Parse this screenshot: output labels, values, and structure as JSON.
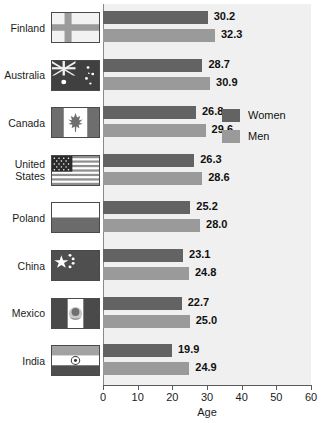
{
  "chart_data": {
    "type": "bar",
    "orientation": "horizontal",
    "title": "",
    "xlabel": "Age",
    "ylabel": "",
    "xlim": [
      0,
      60
    ],
    "xticks": [
      0,
      10,
      20,
      30,
      40,
      50,
      60
    ],
    "grid": false,
    "legend_position": "inside-right",
    "categories": [
      "Finland",
      "Australia",
      "Canada",
      "United\nStates",
      "Poland",
      "China",
      "Mexico",
      "India"
    ],
    "series": [
      {
        "name": "Women",
        "color": "#636363",
        "values": [
          30.2,
          28.7,
          26.8,
          26.3,
          25.2,
          23.1,
          22.7,
          19.9
        ],
        "labels": [
          "30.2",
          "28.7",
          "26.8",
          "26.3",
          "25.2",
          "23.1",
          "22.7",
          "19.9"
        ]
      },
      {
        "name": "Men",
        "color": "#9a9a9a",
        "values": [
          32.3,
          30.9,
          29.6,
          28.6,
          28.0,
          24.8,
          25.0,
          24.9
        ],
        "labels": [
          "32.3",
          "30.9",
          "29.6",
          "28.6",
          "28.0",
          "24.8",
          "25.0",
          "24.9"
        ]
      }
    ]
  },
  "rows": [
    {
      "country": "Finland",
      "flag": "flag-finland-icon",
      "women": "30.2",
      "men": "32.3",
      "women_val": 30.2,
      "men_val": 32.3
    },
    {
      "country": "Australia",
      "flag": "flag-australia-icon",
      "women": "28.7",
      "men": "30.9",
      "women_val": 28.7,
      "men_val": 30.9
    },
    {
      "country": "Canada",
      "flag": "flag-canada-icon",
      "women": "26.8",
      "men": "29.6",
      "women_val": 26.8,
      "men_val": 29.6
    },
    {
      "country": "United\nStates",
      "flag": "flag-usa-icon",
      "women": "26.3",
      "men": "28.6",
      "women_val": 26.3,
      "men_val": 28.6
    },
    {
      "country": "Poland",
      "flag": "flag-poland-icon",
      "women": "25.2",
      "men": "28.0",
      "women_val": 25.2,
      "men_val": 28.0
    },
    {
      "country": "China",
      "flag": "flag-china-icon",
      "women": "23.1",
      "men": "24.8",
      "women_val": 23.1,
      "men_val": 24.8
    },
    {
      "country": "Mexico",
      "flag": "flag-mexico-icon",
      "women": "22.7",
      "men": "25.0",
      "women_val": 22.7,
      "men_val": 25.0
    },
    {
      "country": "India",
      "flag": "flag-india-icon",
      "women": "19.9",
      "men": "24.9",
      "women_val": 19.9,
      "men_val": 24.9
    }
  ],
  "legend": {
    "items": [
      {
        "label": "Women",
        "color": "#636363"
      },
      {
        "label": "Men",
        "color": "#9a9a9a"
      }
    ]
  },
  "axis": {
    "title": "Age",
    "ticks": [
      "0",
      "10",
      "20",
      "30",
      "40",
      "50",
      "60"
    ],
    "tick_values": [
      0,
      10,
      20,
      30,
      40,
      50,
      60
    ],
    "min": 0,
    "max": 60
  },
  "colors": {
    "women": "#636363",
    "men": "#9a9a9a",
    "plot_bg": "#f0f0f0",
    "axis": "#5a5a5a",
    "text": "#1b1b1b"
  }
}
